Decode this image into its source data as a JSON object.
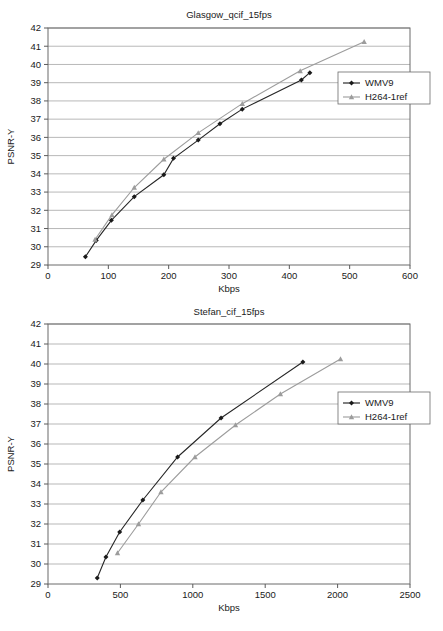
{
  "chart_data": [
    {
      "type": "line",
      "id": "glasgow",
      "title": "Glasgow_qcif_15fps",
      "xlabel": "Kbps",
      "ylabel": "PSNR-Y",
      "xlim": [
        0,
        600
      ],
      "ylim": [
        29,
        42
      ],
      "xticks": [
        0,
        100,
        200,
        300,
        400,
        500,
        600
      ],
      "yticks": [
        29,
        30,
        31,
        32,
        33,
        34,
        35,
        36,
        37,
        38,
        39,
        40,
        41,
        42
      ],
      "grid": "horizontal",
      "legend_position": "right-upper",
      "series": [
        {
          "name": "WMV9",
          "color": "#1a1a1a",
          "marker": "diamond",
          "points": [
            [
              62,
              29.45
            ],
            [
              80,
              30.35
            ],
            [
              105,
              31.45
            ],
            [
              143,
              32.75
            ],
            [
              192,
              33.95
            ],
            [
              208,
              34.85
            ],
            [
              249,
              35.85
            ],
            [
              285,
              36.75
            ],
            [
              322,
              37.55
            ],
            [
              420,
              39.15
            ],
            [
              434,
              39.55
            ]
          ]
        },
        {
          "name": "H264-1ref",
          "color": "#9c9c9c",
          "marker": "triangle",
          "points": [
            [
              78,
              30.4
            ],
            [
              106,
              31.75
            ],
            [
              143,
              33.25
            ],
            [
              192,
              34.8
            ],
            [
              249,
              36.25
            ],
            [
              322,
              37.85
            ],
            [
              418,
              39.65
            ],
            [
              524,
              41.25
            ]
          ]
        }
      ]
    },
    {
      "type": "line",
      "id": "stefan",
      "title": "Stefan_cif_15fps",
      "xlabel": "Kbps",
      "ylabel": "PSNR-Y",
      "xlim": [
        0,
        2500
      ],
      "ylim": [
        29,
        42
      ],
      "xticks": [
        0,
        500,
        1000,
        1500,
        2000,
        2500
      ],
      "yticks": [
        29,
        30,
        31,
        32,
        33,
        34,
        35,
        36,
        37,
        38,
        39,
        40,
        41,
        42
      ],
      "grid": "horizontal",
      "legend_position": "right-middle",
      "series": [
        {
          "name": "WMV9",
          "color": "#1a1a1a",
          "marker": "diamond",
          "points": [
            [
              340,
              29.3
            ],
            [
              400,
              30.35
            ],
            [
              495,
              31.6
            ],
            [
              655,
              33.2
            ],
            [
              895,
              35.35
            ],
            [
              1195,
              37.3
            ],
            [
              1760,
              40.1
            ]
          ]
        },
        {
          "name": "H264-1ref",
          "color": "#9c9c9c",
          "marker": "triangle",
          "points": [
            [
              480,
              30.55
            ],
            [
              625,
              32.0
            ],
            [
              780,
              33.6
            ],
            [
              1015,
              35.35
            ],
            [
              1295,
              36.95
            ],
            [
              1605,
              38.5
            ],
            [
              2020,
              40.25
            ]
          ]
        }
      ]
    }
  ]
}
